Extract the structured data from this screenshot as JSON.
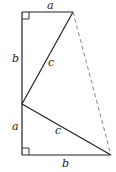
{
  "diagram": {
    "labels": {
      "top_edge": "a",
      "left_upper": "b",
      "upper_hypotenuse": "c",
      "left_lower": "a",
      "lower_hypotenuse": "c",
      "bottom_edge": "b"
    },
    "colors": {
      "stroke": "#222222",
      "dashed": "#888888",
      "background": "#ffffff"
    },
    "vertices": {
      "top_left": [
        22,
        12
      ],
      "top_right": [
        73,
        12
      ],
      "middle_left": [
        22,
        104
      ],
      "bottom_left": [
        22,
        155
      ],
      "bottom_right": [
        111,
        155
      ]
    }
  }
}
